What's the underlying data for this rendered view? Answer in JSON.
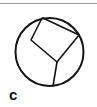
{
  "figure": {
    "label": "c",
    "colors": {
      "stroke": "#141414",
      "background": "#ffffff",
      "rule": "#9a9a9a",
      "label": "#121212"
    },
    "top_rule": {
      "name": "horizontal-rule",
      "y": 3,
      "width": 97,
      "thickness": 1
    },
    "circle": {
      "cx": 49.5,
      "cy": 52,
      "r": 34,
      "stroke_width": 2
    },
    "chords": [
      {
        "name": "left-chord",
        "points": "42,18 31,40 57,62",
        "stroke_width": 1.6
      },
      {
        "name": "right-chord",
        "points": "43,18 79,35 57,62",
        "stroke_width": 1.6
      },
      {
        "name": "bottom-chord",
        "points": "57,62 53,86",
        "stroke_width": 1.6
      }
    ]
  }
}
